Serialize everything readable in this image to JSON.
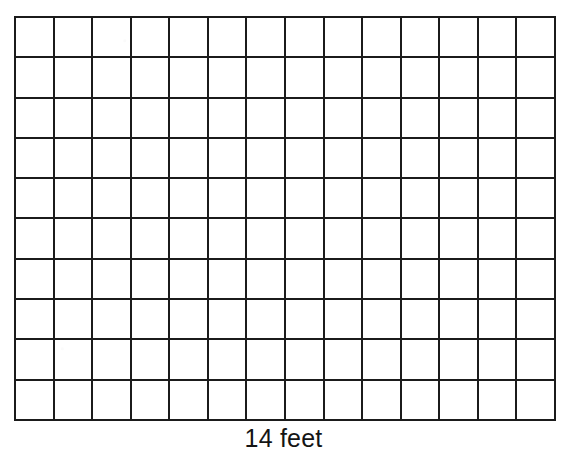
{
  "figure": {
    "type": "rectangular-unit-grid",
    "name": "area-model-grid",
    "columns": 14,
    "rows": 10,
    "total_unit_squares": 140,
    "line_color": "#1b1b1b",
    "line_width_px": 2,
    "fill_color": "#ffffff",
    "background_color": "#ffffff",
    "cell_labels": []
  },
  "labels": {
    "bottom": "14 feet",
    "bottom_value": 14,
    "bottom_unit": "feet"
  },
  "chart_data": {
    "type": "table",
    "title": "",
    "xlabel": "14 feet",
    "ylabel": "",
    "columns": 14,
    "rows": 10,
    "values": [
      [
        0,
        0,
        0,
        0,
        0,
        0,
        0,
        0,
        0,
        0,
        0,
        0,
        0,
        0
      ],
      [
        0,
        0,
        0,
        0,
        0,
        0,
        0,
        0,
        0,
        0,
        0,
        0,
        0,
        0
      ],
      [
        0,
        0,
        0,
        0,
        0,
        0,
        0,
        0,
        0,
        0,
        0,
        0,
        0,
        0
      ],
      [
        0,
        0,
        0,
        0,
        0,
        0,
        0,
        0,
        0,
        0,
        0,
        0,
        0,
        0
      ],
      [
        0,
        0,
        0,
        0,
        0,
        0,
        0,
        0,
        0,
        0,
        0,
        0,
        0,
        0
      ],
      [
        0,
        0,
        0,
        0,
        0,
        0,
        0,
        0,
        0,
        0,
        0,
        0,
        0,
        0
      ],
      [
        0,
        0,
        0,
        0,
        0,
        0,
        0,
        0,
        0,
        0,
        0,
        0,
        0,
        0
      ],
      [
        0,
        0,
        0,
        0,
        0,
        0,
        0,
        0,
        0,
        0,
        0,
        0,
        0,
        0
      ],
      [
        0,
        0,
        0,
        0,
        0,
        0,
        0,
        0,
        0,
        0,
        0,
        0,
        0,
        0
      ],
      [
        0,
        0,
        0,
        0,
        0,
        0,
        0,
        0,
        0,
        0,
        0,
        0,
        0,
        0
      ]
    ],
    "annotations": [
      "14 feet"
    ],
    "grid": true,
    "legend": "none"
  }
}
